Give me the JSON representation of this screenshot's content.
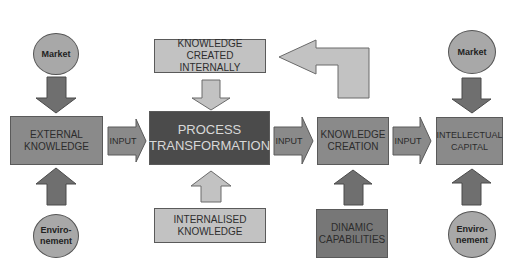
{
  "diagram": {
    "truncated_caption": "",
    "colors": {
      "dark_box": "#4b4b4b",
      "mid_box": "#8a8a8a",
      "light_box": "#c2c2c2",
      "circle": "#a8a8a8",
      "dark_arrow": "#6f6f6f",
      "light_arrow": "#c2c2c2"
    },
    "nodes": {
      "market_left": "Market",
      "environment_left_line1": "Enviro-",
      "environment_left_line2": "nement",
      "external_knowledge_line1": "EXTERNAL",
      "external_knowledge_line2": "KNOWLEDGE",
      "knowledge_created_internally_line1": "KNOWLEDGE",
      "knowledge_created_internally_line2": "CREATED INTERNALLY",
      "process_transformation_line1": "PROCESS",
      "process_transformation_line2": "TRANSFORMATION",
      "internalised_knowledge_line1": "INTERNALISED",
      "internalised_knowledge_line2": "KNOWLEDGE",
      "knowledge_creation_line1": "KNOWLEDGE",
      "knowledge_creation_line2": "CREATION",
      "dinamic_capabilities_line1": "DINAMIC",
      "dinamic_capabilities_line2": "CAPABILITIES",
      "intellectual_capital_line1": "INTELLECTUAL",
      "intellectual_capital_line2": "CAPITAL",
      "market_right": "Market",
      "environment_right_line1": "Enviro-",
      "environment_right_line2": "nement"
    },
    "edges": {
      "input_1": "INPUT",
      "input_2": "INPUT",
      "input_3": "INPUT"
    }
  }
}
